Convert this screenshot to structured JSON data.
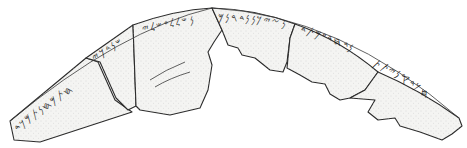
{
  "figure": {
    "background_color": "#ffffff",
    "fragment_fill": "#f4f4f2",
    "outline_color": "#2a2a2a",
    "fragments_count": 6,
    "inscription_segments": [
      {
        "id": "seg1",
        "text": "𐤇𐤕𐤌𐤇𐤍𐤕𐤌𐤊𐤃"
      },
      {
        "id": "seg2",
        "text": "𐤔𐤍𐤃𐤊𐤉"
      },
      {
        "id": "seg3",
        "text": "𐤍𐤔𐤋𐤋𐤏𐤔𐤋𐤉"
      },
      {
        "id": "seg4",
        "text": "𐤍𐤆𐤉𐤊𐤍𐤍𐤃𐤓𐤍𐤌"
      },
      {
        "id": "seg5",
        "text": "𐤍𐤃𐤇𐤃𐤏𐤌𐤕𐤃"
      },
      {
        "id": "seg6",
        "text": "𐤇𐤊𐤃𐤒𐤍𐤉𐤕𐤕"
      }
    ]
  }
}
